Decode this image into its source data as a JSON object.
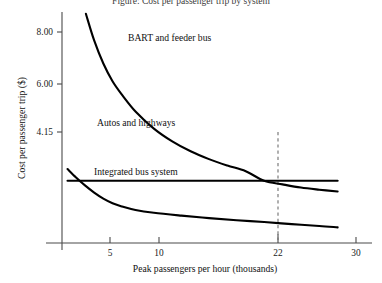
{
  "figure": {
    "title": "Figure: Cost per passenger trip by system",
    "background_color": "#ffffff",
    "curve_color": "#000000",
    "axis_color": "#4a4a4a",
    "guide_color": "#6f6f6f"
  },
  "chart_data": {
    "type": "line",
    "title": "Figure: Cost per passenger trip by system",
    "xlabel": "Peak passengers per hour (thousands)",
    "ylabel": "Cost per passenger trip ($)",
    "xlim": [
      0,
      32
    ],
    "ylim": [
      2.4,
      8.9
    ],
    "grid": false,
    "legend_position": "inline-annotations",
    "x_ticks": [
      5,
      10,
      22,
      30
    ],
    "x_tick_labels": [
      "5",
      "10",
      "22",
      "30"
    ],
    "y_ticks": [
      4.15,
      6.0,
      8.0
    ],
    "y_tick_labels": [
      "4.15",
      "6.00",
      "8.00"
    ],
    "annotations": [
      {
        "text": "BART and feeder bus",
        "x": 8.2,
        "y": 7.55
      },
      {
        "text": "Autos and highways",
        "x": 4.3,
        "y": 4.62
      },
      {
        "text": "Integrated bus system",
        "x": 4.2,
        "y": 3.43
      }
    ],
    "reference_line": {
      "name": "breakeven-marker",
      "x": 22,
      "label": "22",
      "style": "dashed",
      "from_y": 4.15,
      "to_y": 2.45
    },
    "series": [
      {
        "name": "BART and feeder bus",
        "x": [
          2.6,
          3.5,
          4.5,
          5.5,
          6.5,
          8.0,
          10.0,
          12.0,
          14.0,
          16.0,
          18.0,
          20.0,
          22.0,
          24.0,
          26.0,
          28.0,
          30.0
        ],
        "values": [
          8.85,
          8.1,
          7.45,
          6.95,
          6.58,
          6.1,
          5.62,
          5.26,
          4.98,
          4.76,
          4.58,
          4.42,
          4.15,
          4.05,
          3.96,
          3.9,
          3.85
        ],
        "color": "#000000"
      },
      {
        "name": "Autos and highways",
        "x": [
          0.6,
          30.0
        ],
        "values": [
          4.15,
          4.15
        ],
        "color": "#000000"
      },
      {
        "name": "Integrated bus system",
        "x": [
          0.6,
          1.5,
          2.5,
          3.5,
          4.5,
          5.5,
          6.5,
          8.0,
          10.0,
          13.0,
          16.0,
          19.0,
          22.0,
          25.0,
          28.0,
          30.0
        ],
        "values": [
          4.48,
          4.25,
          4.02,
          3.82,
          3.65,
          3.52,
          3.43,
          3.33,
          3.25,
          3.17,
          3.1,
          3.04,
          2.99,
          2.93,
          2.88,
          2.84
        ],
        "color": "#000000"
      }
    ]
  }
}
